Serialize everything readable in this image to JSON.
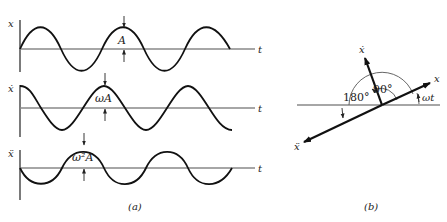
{
  "figure": {
    "panel_a": {
      "caption": "(a)",
      "plots": [
        {
          "y_label": "x",
          "x_label": "t",
          "amplitude_label": "A",
          "phase": "sin"
        },
        {
          "y_label": "ẋ",
          "x_label": "t",
          "amplitude_label": "ωA",
          "phase": "cos"
        },
        {
          "y_label": "ẍ",
          "x_label": "t",
          "amplitude_label": "ω²A",
          "phase": "-sin"
        }
      ]
    },
    "panel_b": {
      "caption": "(b)",
      "vectors": [
        {
          "label": "x",
          "angle_deg": 20
        },
        {
          "label": "ẋ",
          "angle_deg": 110
        },
        {
          "label": "ẍ",
          "angle_deg": 200
        }
      ],
      "angle_labels": {
        "phase_90": "90°",
        "phase_180": "180°",
        "rotation": "ωt"
      }
    }
  }
}
